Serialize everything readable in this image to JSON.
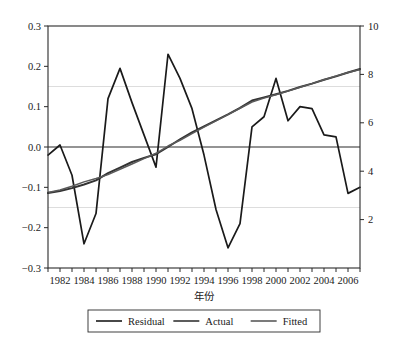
{
  "chart_data": {
    "type": "line",
    "title": "",
    "subtitle": "",
    "xlabel": "年份",
    "ylabel": "",
    "ylabel_right": "",
    "grid": "horizontal-faint",
    "legend_position": "bottom",
    "x": [
      1981,
      1982,
      1983,
      1984,
      1985,
      1986,
      1987,
      1988,
      1989,
      1990,
      1991,
      1992,
      1993,
      1994,
      1995,
      1996,
      1997,
      1998,
      1999,
      2000,
      2001,
      2002,
      2003,
      2004,
      2005,
      2006,
      2007
    ],
    "xlim": [
      1981,
      2007
    ],
    "xticks": [
      1982,
      1984,
      1986,
      1988,
      1990,
      1992,
      1994,
      1996,
      1998,
      2000,
      2002,
      2004,
      2006
    ],
    "xticklabels": [
      "1982",
      "1984",
      "1986",
      "1988",
      "1990",
      "1992",
      "1994",
      "1996",
      "1998",
      "2000",
      "2002",
      "2004",
      "2006"
    ],
    "ylim_left": [
      -0.3,
      0.3
    ],
    "yticks_left": [
      -0.3,
      -0.2,
      -0.1,
      0.0,
      0.1,
      0.2,
      0.3
    ],
    "yticklabels_left": [
      "−0.3",
      "−0.2",
      "−0.1",
      "0.0",
      "0.1",
      "0.2",
      "0.3"
    ],
    "ylim_right": [
      0,
      10
    ],
    "yticks_right": [
      2,
      4,
      6,
      8,
      10
    ],
    "yticklabels_right": [
      "2",
      "4",
      "6",
      "8",
      "10"
    ],
    "gridline_values_left": [
      0.15,
      -0.15
    ],
    "zero_line_left": 0.0,
    "series": [
      {
        "name": "Residual",
        "axis": "left",
        "color": "#1a1a1a",
        "style": "solid",
        "values": [
          -0.02,
          0.005,
          -0.07,
          -0.24,
          -0.165,
          0.12,
          0.195,
          0.11,
          0.03,
          -0.05,
          0.23,
          0.17,
          0.095,
          -0.02,
          -0.155,
          -0.25,
          -0.19,
          0.05,
          0.075,
          0.17,
          0.065,
          0.1,
          0.095,
          0.03,
          0.025,
          -0.115,
          -0.1
        ]
      },
      {
        "name": "Actual",
        "axis": "right",
        "color": "#333333",
        "style": "solid",
        "values": [
          3.1,
          3.18,
          3.3,
          3.45,
          3.62,
          3.92,
          4.15,
          4.38,
          4.55,
          4.7,
          5.0,
          5.32,
          5.6,
          5.85,
          6.1,
          6.35,
          6.62,
          6.92,
          7.05,
          7.18,
          7.32,
          7.48,
          7.62,
          7.78,
          7.92,
          8.08,
          8.22
        ]
      },
      {
        "name": "Fitted",
        "axis": "right",
        "color": "#5a5a5a",
        "style": "solid",
        "values": [
          3.12,
          3.22,
          3.38,
          3.56,
          3.7,
          3.86,
          4.08,
          4.3,
          4.52,
          4.74,
          5.04,
          5.28,
          5.55,
          5.82,
          6.08,
          6.34,
          6.6,
          6.86,
          7.02,
          7.16,
          7.31,
          7.47,
          7.62,
          7.78,
          7.93,
          8.08,
          8.2
        ]
      }
    ]
  },
  "legend": {
    "entries": [
      "Residual",
      "Actual",
      "Fitted"
    ]
  },
  "axis_title_x": "年份"
}
